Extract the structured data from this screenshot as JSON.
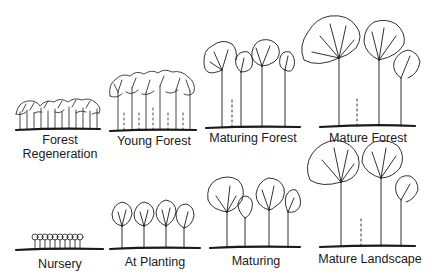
{
  "rows": [
    {
      "name": "forest",
      "stages": [
        {
          "label_line1": "Forest",
          "label_line2": "Regeneration"
        },
        {
          "label_line1": "Young Forest"
        },
        {
          "label_line1": "Maturing Forest"
        },
        {
          "label_line1": "Mature Forest"
        }
      ]
    },
    {
      "name": "landscape",
      "stages": [
        {
          "label_line1": "Nursery"
        },
        {
          "label_line1": "At Planting"
        },
        {
          "label_line1": "Maturing"
        },
        {
          "label_line1": "Mature Landscape"
        }
      ]
    }
  ],
  "colors": {
    "ink": "#1a1a1a",
    "background": "#ffffff"
  }
}
